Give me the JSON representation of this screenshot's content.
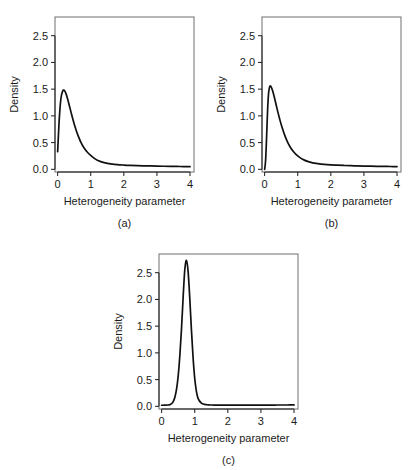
{
  "figure": {
    "background": "#ffffff",
    "curve_color": "#111111",
    "frame_color": "#6e6e6e",
    "axis_color": "#1b1b1b"
  },
  "panels": [
    {
      "key": "a",
      "label": "(a)",
      "xlabel": "Heterogeneity parameter",
      "ylabel": "Density"
    },
    {
      "key": "b",
      "label": "(b)",
      "xlabel": "Heterogeneity parameter",
      "ylabel": "Density"
    },
    {
      "key": "c",
      "label": "(c)",
      "xlabel": "Heterogeneity parameter",
      "ylabel": "Density"
    }
  ],
  "chart_data": [
    {
      "type": "line",
      "panel": "a",
      "title": "",
      "subtitle": "",
      "xlabel": "Heterogeneity parameter",
      "ylabel": "Density",
      "xlim": [
        -0.08,
        4.12
      ],
      "ylim": [
        -0.05,
        2.85
      ],
      "xticks": [
        0,
        1,
        2,
        3,
        4
      ],
      "xtick_labels": [
        "0",
        "1",
        "2",
        "3",
        "4"
      ],
      "yticks": [
        0.0,
        0.5,
        1.0,
        1.5,
        2.0,
        2.5
      ],
      "ytick_labels": [
        "0.0",
        "0.5",
        "1.0",
        "1.5",
        "2.0",
        "2.5"
      ],
      "grid": false,
      "legend": false,
      "annotations": [
        "(a)"
      ],
      "peak": {
        "x": 0.2,
        "y": 1.48
      },
      "x": [
        0.0,
        0.05,
        0.1,
        0.15,
        0.2,
        0.25,
        0.3,
        0.35,
        0.4,
        0.45,
        0.5,
        0.55,
        0.6,
        0.7,
        0.8,
        0.9,
        1.0,
        1.1,
        1.2,
        1.3,
        1.4,
        1.5,
        1.6,
        1.8,
        2.0,
        2.2,
        2.4,
        2.6,
        2.8,
        3.0,
        3.2,
        3.4,
        3.6,
        3.8,
        4.0
      ],
      "y": [
        0.33,
        0.95,
        1.33,
        1.46,
        1.48,
        1.42,
        1.32,
        1.2,
        1.08,
        0.96,
        0.85,
        0.75,
        0.66,
        0.51,
        0.4,
        0.32,
        0.26,
        0.21,
        0.17,
        0.145,
        0.125,
        0.112,
        0.102,
        0.088,
        0.08,
        0.074,
        0.07,
        0.066,
        0.063,
        0.06,
        0.058,
        0.056,
        0.054,
        0.052,
        0.05
      ]
    },
    {
      "type": "line",
      "panel": "b",
      "title": "",
      "subtitle": "",
      "xlabel": "Heterogeneity parameter",
      "ylabel": "Density",
      "xlim": [
        -0.08,
        4.12
      ],
      "ylim": [
        -0.05,
        2.85
      ],
      "xticks": [
        0,
        1,
        2,
        3,
        4
      ],
      "xtick_labels": [
        "0",
        "1",
        "2",
        "3",
        "4"
      ],
      "yticks": [
        0.0,
        0.5,
        1.0,
        1.5,
        2.0,
        2.5
      ],
      "ytick_labels": [
        "0.0",
        "0.5",
        "1.0",
        "1.5",
        "2.0",
        "2.5"
      ],
      "grid": false,
      "legend": false,
      "annotations": [
        "(b)"
      ],
      "peak": {
        "x": 0.17,
        "y": 1.56
      },
      "x": [
        0.0,
        0.03,
        0.06,
        0.09,
        0.12,
        0.15,
        0.17,
        0.2,
        0.25,
        0.3,
        0.35,
        0.4,
        0.45,
        0.5,
        0.6,
        0.7,
        0.8,
        0.9,
        1.0,
        1.1,
        1.2,
        1.3,
        1.4,
        1.5,
        1.6,
        1.8,
        2.0,
        2.2,
        2.4,
        2.6,
        2.8,
        3.0,
        3.2,
        3.4,
        3.6,
        3.8,
        4.0
      ],
      "y": [
        0.0,
        0.18,
        0.62,
        1.12,
        1.43,
        1.54,
        1.56,
        1.54,
        1.45,
        1.33,
        1.2,
        1.07,
        0.95,
        0.84,
        0.65,
        0.5,
        0.39,
        0.31,
        0.25,
        0.205,
        0.172,
        0.148,
        0.13,
        0.116,
        0.106,
        0.092,
        0.083,
        0.077,
        0.072,
        0.068,
        0.064,
        0.061,
        0.059,
        0.057,
        0.055,
        0.053,
        0.051
      ]
    },
    {
      "type": "line",
      "panel": "c",
      "title": "",
      "subtitle": "",
      "xlabel": "Heterogeneity parameter",
      "ylabel": "Density",
      "xlim": [
        -0.08,
        4.12
      ],
      "ylim": [
        -0.05,
        2.85
      ],
      "xticks": [
        0,
        1,
        2,
        3,
        4
      ],
      "xtick_labels": [
        "0",
        "1",
        "2",
        "3",
        "4"
      ],
      "yticks": [
        0.0,
        0.5,
        1.0,
        1.5,
        2.0,
        2.5
      ],
      "ytick_labels": [
        "0.0",
        "0.5",
        "1.0",
        "1.5",
        "2.0",
        "2.5"
      ],
      "grid": false,
      "legend": false,
      "annotations": [
        "(c)"
      ],
      "peak": {
        "x": 0.7,
        "y": 2.73
      },
      "x": [
        0.0,
        0.1,
        0.2,
        0.25,
        0.3,
        0.35,
        0.4,
        0.45,
        0.5,
        0.55,
        0.6,
        0.65,
        0.7,
        0.75,
        0.8,
        0.85,
        0.9,
        0.95,
        1.0,
        1.05,
        1.1,
        1.2,
        1.3,
        1.4,
        1.5,
        1.6,
        1.8,
        2.0,
        2.2,
        2.4,
        2.6,
        2.8,
        3.0,
        3.2,
        3.4,
        3.6,
        3.8,
        4.0
      ],
      "y": [
        0.02,
        0.021,
        0.025,
        0.032,
        0.05,
        0.09,
        0.17,
        0.32,
        0.57,
        0.95,
        1.45,
        2.05,
        2.56,
        2.73,
        2.52,
        2.02,
        1.43,
        0.91,
        0.52,
        0.28,
        0.15,
        0.06,
        0.036,
        0.028,
        0.025,
        0.024,
        0.023,
        0.023,
        0.023,
        0.023,
        0.023,
        0.023,
        0.024,
        0.024,
        0.024,
        0.025,
        0.025,
        0.026
      ]
    }
  ]
}
